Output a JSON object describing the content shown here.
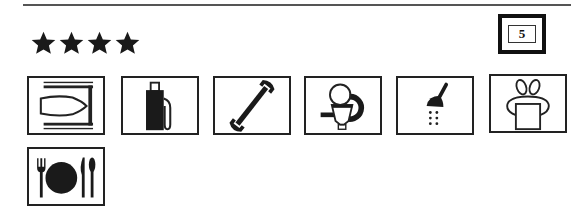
{
  "header": {
    "star_rating": 4,
    "stars": [
      "star",
      "star",
      "star",
      "star"
    ],
    "category_badge": "5"
  },
  "facilities": [
    {
      "name": "boat-slip-icon",
      "label": "Boat berth"
    },
    {
      "name": "fuel-pump-icon",
      "label": "Fuel"
    },
    {
      "name": "wrench-icon",
      "label": "Repairs"
    },
    {
      "name": "toilet-icon",
      "label": "Toilets"
    },
    {
      "name": "shower-icon",
      "label": "Showers"
    },
    {
      "name": "laundry-icon",
      "label": "Laundry"
    },
    {
      "name": "restaurant-icon",
      "label": "Restaurant"
    }
  ],
  "colors": {
    "ink": "#111111",
    "rule": "#555555",
    "background": "#ffffff"
  }
}
